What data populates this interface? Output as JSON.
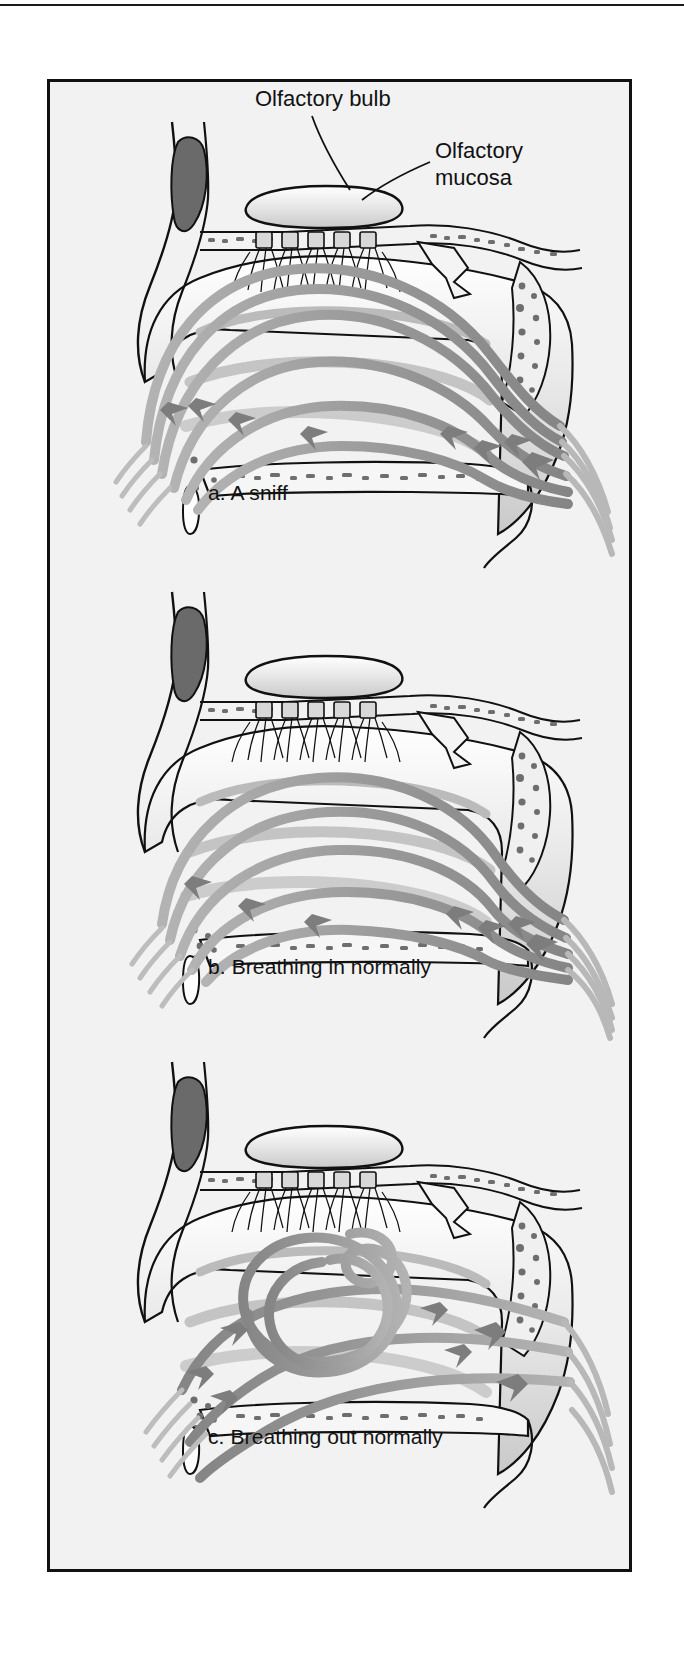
{
  "figure": {
    "kind": "anatomical-illustration",
    "background_color": "#f2f2f2",
    "frame_color": "#111111",
    "page_color": "#ffffff",
    "airflow_color": "#9a9a9a",
    "airflow_dark_color": "#6f6f6f",
    "outline_color": "#111111",
    "bone_stipple_color": "#6e6e6e",
    "sinus_fill_color": "#6a6a6a"
  },
  "labels": {
    "olfactory_bulb": "Olfactory bulb",
    "olfactory_mucosa": "Olfactory\nmucosa"
  },
  "panels": [
    {
      "id": "a",
      "caption": "a. A sniff",
      "airflow_description": "Several streamlines arch high into the upper nasal cavity and pass directly across the olfactory mucosa before curving down to the nasopharynx.",
      "stream_count": 6,
      "reaches_olfactory_region": true,
      "turbulent": false
    },
    {
      "id": "b",
      "caption": "b. Breathing in normally",
      "airflow_description": "Streamlines stay lower in the nasal cavity; only the uppermost stream grazes the region beneath the olfactory mucosa.",
      "stream_count": 5,
      "reaches_olfactory_region": false,
      "turbulent": false
    },
    {
      "id": "c",
      "caption": "c. Breathing out normally",
      "airflow_description": "Air flowing outward forms a looping eddy beneath the cribriform plate, with streams exiting forward through the nostril.",
      "stream_count": 5,
      "reaches_olfactory_region": false,
      "turbulent": true
    }
  ],
  "anatomy_parts": [
    "olfactory bulb",
    "olfactory nerve fascicles",
    "cribriform plate",
    "olfactory mucosa",
    "frontal sinus",
    "superior turbinate",
    "middle turbinate",
    "inferior turbinate",
    "sphenoid sinus",
    "hard palate",
    "soft palate",
    "nostril",
    "nasopharynx"
  ]
}
